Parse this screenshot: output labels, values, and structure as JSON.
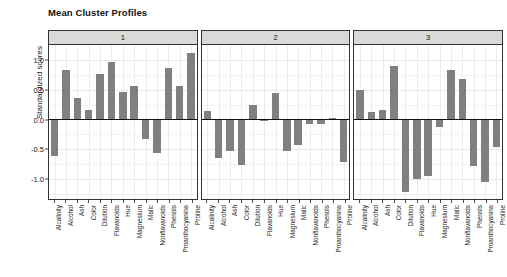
{
  "chart_data": {
    "type": "bar",
    "title": "Mean Cluster Profiles",
    "xlabel": "",
    "ylabel": "Standardized scores",
    "ylim": [
      -1.35,
      1.25
    ],
    "yticks": [
      "1.0",
      "0.5",
      "0.0",
      "-0.5",
      "-1.0"
    ],
    "ytick_values": [
      1.0,
      0.5,
      0.0,
      -0.5,
      -1.0
    ],
    "grid": true,
    "legend": "none",
    "facet_labels": [
      "1",
      "2",
      "3"
    ],
    "bar_color": "#808080",
    "categories": [
      "Alcalinity",
      "Alcohol",
      "Ash",
      "Color",
      "Dilution",
      "Flavanoids",
      "Hue",
      "Magnesium",
      "Malic",
      "Nonflavanoids",
      "Phenols",
      "Proanthocyanins",
      "Proline"
    ],
    "series": [
      {
        "name": "1",
        "values": [
          -0.61,
          0.83,
          0.36,
          0.16,
          0.77,
          0.97,
          0.47,
          0.57,
          -0.32,
          -0.57,
          0.87,
          0.57,
          1.11
        ]
      },
      {
        "name": "2",
        "values": [
          0.15,
          -0.65,
          -0.53,
          -0.77,
          0.25,
          -0.02,
          0.44,
          -0.52,
          -0.42,
          -0.08,
          -0.07,
          0.03,
          -0.72
        ]
      },
      {
        "name": "3",
        "values": [
          0.5,
          0.13,
          0.16,
          0.9,
          -1.22,
          -1.0,
          -0.95,
          -0.12,
          0.83,
          0.68,
          -0.78,
          -1.05,
          -0.46
        ]
      }
    ]
  }
}
